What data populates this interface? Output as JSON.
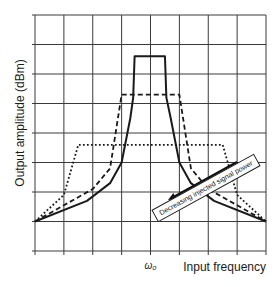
{
  "chart_data": {
    "type": "line",
    "title": "",
    "xlabel": "Input frequency",
    "ylabel": "Output amplitude (dBm)",
    "x_tick_labels": [
      {
        "x": 4,
        "label": "ω₀"
      }
    ],
    "x_range": [
      0,
      8
    ],
    "y_range": [
      0,
      8
    ],
    "grid": true,
    "legend": null,
    "series": [
      {
        "name": "high injected power",
        "style": "solid",
        "points": [
          [
            0,
            1
          ],
          [
            1.8,
            1.7
          ],
          [
            2.6,
            2.3
          ],
          [
            3,
            3
          ],
          [
            3.3,
            4.5
          ],
          [
            3.4,
            5.2
          ],
          [
            3.45,
            6.6
          ],
          [
            4.5,
            6.6
          ],
          [
            4.55,
            5.2
          ],
          [
            4.7,
            4.5
          ],
          [
            5,
            3
          ],
          [
            5.4,
            2.3
          ],
          [
            6.2,
            1.7
          ],
          [
            8,
            1
          ]
        ]
      },
      {
        "name": "medium injected power",
        "style": "dashed",
        "points": [
          [
            0,
            1
          ],
          [
            1,
            1.55
          ],
          [
            2,
            2.1
          ],
          [
            2.6,
            2.8
          ],
          [
            3,
            5.3
          ],
          [
            5,
            5.3
          ],
          [
            5.4,
            2.8
          ],
          [
            6,
            2.1
          ],
          [
            7,
            1.55
          ],
          [
            8,
            1
          ]
        ]
      },
      {
        "name": "low injected power",
        "style": "dotted",
        "points": [
          [
            0,
            1
          ],
          [
            1,
            1.9
          ],
          [
            1.5,
            3.6
          ],
          [
            6.5,
            3.6
          ],
          [
            7,
            1.9
          ],
          [
            8,
            1
          ]
        ]
      }
    ],
    "annotations": [
      {
        "text": "Decreasing injected signal power",
        "type": "arrow-label",
        "direction": "down-left"
      }
    ]
  }
}
